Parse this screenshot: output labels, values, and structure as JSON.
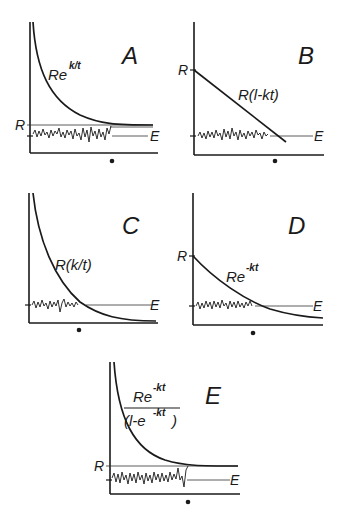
{
  "figure": {
    "panels": [
      {
        "id": "A",
        "letter": "A",
        "formula_base": "Re",
        "formula_exp": "k/t",
        "r_label": "R",
        "e_label": "E",
        "curve": "Re^(k/t) hyperbolic decay toward R"
      },
      {
        "id": "B",
        "letter": "B",
        "formula": "R(l-kt)",
        "r_label": "R",
        "e_label": "E",
        "curve": "linear decline from R"
      },
      {
        "id": "C",
        "letter": "C",
        "formula": "R(k/t)",
        "e_label": "E",
        "curve": "hyperbolic decay toward zero"
      },
      {
        "id": "D",
        "letter": "D",
        "formula_base": "Re",
        "formula_exp": "-kt",
        "r_label": "R",
        "e_label": "E",
        "curve": "exponential decay from R"
      },
      {
        "id": "E",
        "letter": "E",
        "formula_num_base": "Re",
        "formula_num_exp": "-kt",
        "formula_den_base": "(l-e",
        "formula_den_exp": "-kt",
        "formula_den_close": ")",
        "r_label": "R",
        "e_label": "E",
        "curve": "decay toward R"
      }
    ]
  }
}
